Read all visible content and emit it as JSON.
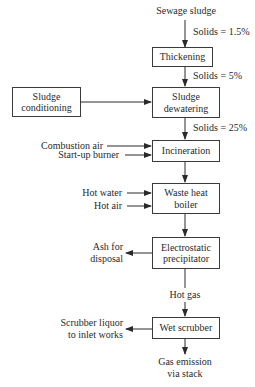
{
  "diagram": {
    "type": "process-flow",
    "title": "",
    "nodes": {
      "thickening": "Thickening",
      "sludge_conditioning_line1": "Sludge",
      "sludge_conditioning_line2": "conditioning",
      "sludge_dewatering_line1": "Sludge",
      "sludge_dewatering_line2": "dewatering",
      "incineration": "Incineration",
      "waste_heat_boiler_line1": "Waste heat",
      "waste_heat_boiler_line2": "boiler",
      "electrostatic_precipitator_line1": "Electrostatic",
      "electrostatic_precipitator_line2": "precipitator",
      "wet_scrubber": "Wet scrubber"
    },
    "labels": {
      "input": "Sewage sludge",
      "solids_1": "Solids = 1.5%",
      "solids_2": "Solids = 5%",
      "solids_3": "Solids = 25%",
      "combustion_air": "Combustion air",
      "startup_burner": "Start-up burner",
      "hot_water": "Hot water",
      "hot_air": "Hot air",
      "ash_line1": "Ash for",
      "ash_line2": "disposal",
      "hot_gas": "Hot gas",
      "scrubber_liquor_line1": "Scrubber liquor",
      "scrubber_liquor_line2": "to inlet works",
      "output_line1": "Gas emission",
      "output_line2": "via stack"
    },
    "edges": [
      {
        "from": "Sewage sludge",
        "to": "Thickening",
        "label": "Solids = 1.5%"
      },
      {
        "from": "Thickening",
        "to": "Sludge dewatering",
        "label": "Solids = 5%"
      },
      {
        "from": "Sludge conditioning",
        "to": "Sludge dewatering"
      },
      {
        "from": "Sludge dewatering",
        "to": "Incineration",
        "label": "Solids = 25%"
      },
      {
        "from": "Combustion air",
        "to": "Incineration"
      },
      {
        "from": "Start-up burner",
        "to": "Incineration"
      },
      {
        "from": "Incineration",
        "to": "Waste heat boiler"
      },
      {
        "from": "Hot water",
        "to": "Waste heat boiler"
      },
      {
        "from": "Hot air",
        "to": "Waste heat boiler"
      },
      {
        "from": "Waste heat boiler",
        "to": "Electrostatic precipitator"
      },
      {
        "from": "Electrostatic precipitator",
        "to": "Ash for disposal"
      },
      {
        "from": "Electrostatic precipitator",
        "to": "Wet scrubber",
        "label": "Hot gas"
      },
      {
        "from": "Wet scrubber",
        "to": "Scrubber liquor to inlet works"
      },
      {
        "from": "Wet scrubber",
        "to": "Gas emission via stack"
      }
    ]
  }
}
